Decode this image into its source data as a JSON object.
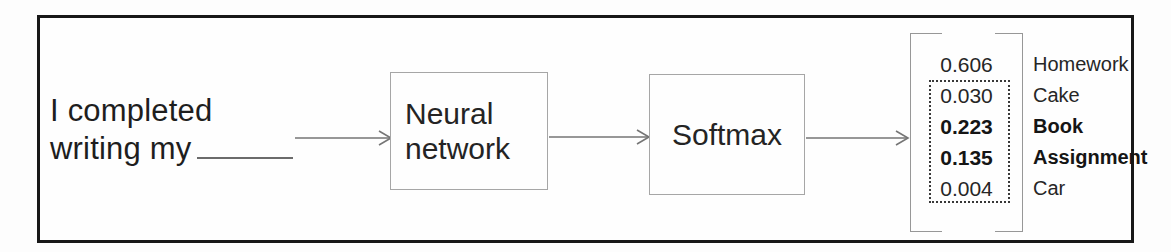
{
  "figure": {
    "input_text": {
      "line1": "I completed",
      "line2": "writing my"
    },
    "neural_network_box": {
      "line1": "Neural",
      "line2": "network"
    },
    "softmax_box": {
      "label": "Softmax"
    },
    "output_vector": {
      "rows": [
        {
          "value": "0.606",
          "label": "Homework",
          "bold": false,
          "in_dotted_box": false
        },
        {
          "value": "0.030",
          "label": "Cake",
          "bold": false,
          "in_dotted_box": true
        },
        {
          "value": "0.223",
          "label": "Book",
          "bold": true,
          "in_dotted_box": true
        },
        {
          "value": "0.135",
          "label": "Assignment",
          "bold": true,
          "in_dotted_box": true
        },
        {
          "value": "0.004",
          "label": "Car",
          "bold": false,
          "in_dotted_box": true
        }
      ]
    },
    "colors": {
      "frame_border": "#181818",
      "box_border": "#a6a6a6",
      "arrow": "#757575",
      "text": "#1e1e1e",
      "bracket": "#979797",
      "dotted_box": "#383838"
    }
  }
}
